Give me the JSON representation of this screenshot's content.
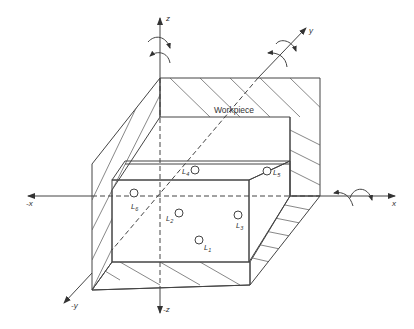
{
  "figure": {
    "type": "3D workpiece fixturing diagram",
    "workpiece_label": "Workpiece",
    "axes": [
      {
        "name": "z",
        "label": "z",
        "direction": "up",
        "rotation_arrow": true
      },
      {
        "name": "-z",
        "label": "-z",
        "direction": "down",
        "rotation_arrow": false
      },
      {
        "name": "x",
        "label": "x",
        "direction": "right",
        "rotation_arrow": true
      },
      {
        "name": "-x",
        "label": "-x",
        "direction": "left",
        "rotation_arrow": false
      },
      {
        "name": "y",
        "label": "y",
        "direction": "up-right (depth)",
        "rotation_arrow": true
      },
      {
        "name": "-y",
        "label": "-y",
        "direction": "down-left (depth)",
        "rotation_arrow": false
      }
    ],
    "locators": [
      {
        "id": "L1",
        "base": "L",
        "sub": "1"
      },
      {
        "id": "L2",
        "base": "L",
        "sub": "2"
      },
      {
        "id": "L3",
        "base": "L",
        "sub": "3"
      },
      {
        "id": "L4",
        "base": "L",
        "sub": "4"
      },
      {
        "id": "L5",
        "base": "L",
        "sub": "5"
      },
      {
        "id": "L6",
        "base": "L",
        "sub": "6"
      }
    ],
    "colors": {
      "line": "#444444",
      "background": "#ffffff"
    }
  }
}
